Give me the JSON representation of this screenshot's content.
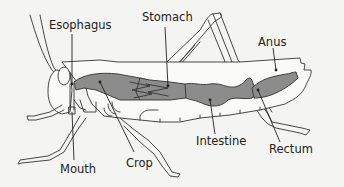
{
  "diagram": {
    "labels": {
      "esophagus": "Esophagus",
      "stomach": "Stomach",
      "anus": "Anus",
      "mouth": "Mouth",
      "crop": "Crop",
      "intestine": "Intestine",
      "rectum": "Rectum"
    },
    "colors": {
      "background": "#f4f4f2",
      "digestive_tract": "#8c8c8c",
      "outline": "#333333",
      "text": "#222222"
    }
  }
}
